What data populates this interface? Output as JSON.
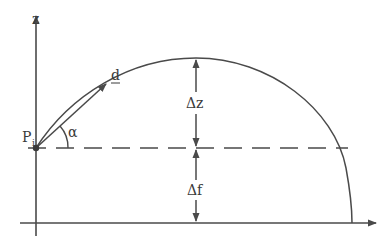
{
  "diagram": {
    "axes": {
      "vertical_label": "z"
    },
    "point": {
      "label": "P",
      "subscript": "i"
    },
    "vector": {
      "label": "d"
    },
    "angle": {
      "label": "α"
    },
    "dimensions": {
      "upper": "Δz",
      "lower": "Δf"
    },
    "colors": {
      "stroke": "#4a4a4a",
      "background": "#ffffff"
    }
  }
}
